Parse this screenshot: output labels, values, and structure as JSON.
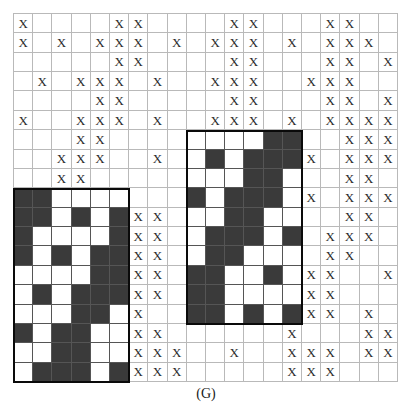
{
  "figure": {
    "caption": "(G)",
    "mark_glyph": "X",
    "grid": {
      "columns": 20,
      "rows": 19
    },
    "colors": {
      "mark": "#2b2b2b",
      "gridline": "#b9b9b9",
      "region_border": "#0a0a0a",
      "dark_cell": "#3a3a3a",
      "light_cell": "#ffffff",
      "background": "#ffffff"
    },
    "regions": [
      {
        "name": "left-region",
        "col_start": 0,
        "col_end": 5,
        "row_start": 9,
        "row_end": 18
      },
      {
        "name": "right-region",
        "col_start": 9,
        "col_end": 14,
        "row_start": 6,
        "row_end": 15
      }
    ],
    "marks": [
      [
        1,
        0,
        0,
        0,
        0,
        1,
        1,
        0,
        0,
        0,
        0,
        1,
        1,
        0,
        0,
        0,
        1,
        1,
        0,
        0
      ],
      [
        1,
        0,
        1,
        0,
        1,
        1,
        1,
        0,
        1,
        0,
        1,
        1,
        1,
        0,
        1,
        0,
        1,
        1,
        1,
        0
      ],
      [
        0,
        0,
        0,
        0,
        0,
        1,
        1,
        0,
        0,
        0,
        0,
        1,
        1,
        0,
        0,
        0,
        1,
        1,
        0,
        1
      ],
      [
        0,
        1,
        0,
        1,
        1,
        1,
        0,
        1,
        0,
        0,
        1,
        1,
        1,
        0,
        0,
        1,
        1,
        1,
        0,
        0
      ],
      [
        0,
        0,
        0,
        0,
        1,
        1,
        0,
        0,
        0,
        0,
        0,
        1,
        1,
        0,
        0,
        0,
        1,
        1,
        0,
        1
      ],
      [
        1,
        0,
        0,
        1,
        1,
        1,
        0,
        1,
        0,
        0,
        1,
        1,
        1,
        0,
        1,
        0,
        1,
        1,
        1,
        1
      ],
      [
        0,
        0,
        0,
        1,
        1,
        0,
        0,
        0,
        0,
        0,
        0,
        0,
        0,
        0,
        0,
        0,
        0,
        1,
        1,
        1
      ],
      [
        0,
        0,
        1,
        1,
        1,
        0,
        0,
        1,
        0,
        0,
        0,
        0,
        0,
        0,
        0,
        1,
        0,
        1,
        1,
        1
      ],
      [
        0,
        0,
        1,
        1,
        0,
        0,
        0,
        0,
        0,
        0,
        0,
        0,
        0,
        0,
        0,
        0,
        0,
        1,
        1,
        0
      ],
      [
        0,
        0,
        0,
        0,
        0,
        0,
        0,
        0,
        0,
        0,
        0,
        0,
        0,
        0,
        0,
        1,
        0,
        1,
        1,
        1
      ],
      [
        0,
        0,
        0,
        0,
        0,
        0,
        1,
        1,
        0,
        0,
        0,
        0,
        0,
        0,
        0,
        0,
        0,
        1,
        1,
        0
      ],
      [
        0,
        0,
        0,
        0,
        0,
        0,
        1,
        1,
        0,
        0,
        0,
        0,
        0,
        0,
        1,
        0,
        1,
        1,
        1,
        0
      ],
      [
        0,
        0,
        0,
        0,
        0,
        0,
        1,
        1,
        0,
        0,
        0,
        0,
        0,
        0,
        0,
        0,
        1,
        1,
        0,
        0
      ],
      [
        0,
        0,
        0,
        0,
        0,
        0,
        1,
        1,
        0,
        0,
        0,
        0,
        0,
        0,
        1,
        1,
        1,
        0,
        0,
        1
      ],
      [
        0,
        0,
        0,
        0,
        0,
        0,
        1,
        1,
        0,
        0,
        0,
        0,
        0,
        0,
        0,
        1,
        1,
        0,
        0,
        0
      ],
      [
        0,
        0,
        0,
        0,
        0,
        0,
        1,
        0,
        0,
        0,
        0,
        0,
        0,
        0,
        1,
        1,
        1,
        0,
        1,
        0
      ],
      [
        0,
        0,
        0,
        0,
        0,
        0,
        1,
        1,
        0,
        0,
        0,
        0,
        0,
        0,
        1,
        0,
        0,
        0,
        1,
        1
      ],
      [
        0,
        0,
        0,
        0,
        0,
        0,
        1,
        1,
        1,
        0,
        0,
        1,
        0,
        0,
        1,
        1,
        1,
        0,
        1,
        1
      ],
      [
        0,
        0,
        0,
        0,
        0,
        0,
        1,
        1,
        1,
        0,
        0,
        0,
        0,
        0,
        1,
        1,
        1,
        0,
        0,
        0
      ]
    ],
    "pattern_left": [
      [
        1,
        1,
        0,
        0,
        0,
        0
      ],
      [
        1,
        1,
        0,
        1,
        0,
        1
      ],
      [
        1,
        0,
        0,
        0,
        0,
        1
      ],
      [
        1,
        0,
        1,
        0,
        1,
        1
      ],
      [
        0,
        0,
        0,
        0,
        1,
        1
      ],
      [
        0,
        1,
        0,
        1,
        1,
        1
      ],
      [
        0,
        0,
        0,
        1,
        1,
        0
      ],
      [
        1,
        0,
        1,
        1,
        0,
        0
      ],
      [
        0,
        0,
        1,
        1,
        0,
        0
      ],
      [
        0,
        1,
        1,
        1,
        0,
        1
      ],
      [
        0,
        1,
        1,
        0,
        0,
        0
      ],
      [
        1,
        1,
        1,
        0,
        1,
        0
      ]
    ],
    "pattern_right": [
      [
        0,
        0,
        0,
        0,
        1,
        1
      ],
      [
        0,
        1,
        0,
        1,
        1,
        1
      ],
      [
        0,
        0,
        0,
        1,
        1,
        0
      ],
      [
        1,
        0,
        1,
        1,
        1,
        0
      ],
      [
        0,
        0,
        1,
        1,
        0,
        0
      ],
      [
        0,
        1,
        1,
        1,
        0,
        1
      ],
      [
        0,
        1,
        1,
        0,
        0,
        0
      ],
      [
        1,
        1,
        0,
        0,
        1,
        0
      ],
      [
        1,
        1,
        0,
        0,
        0,
        0
      ],
      [
        1,
        1,
        0,
        1,
        0,
        1
      ],
      [
        1,
        0,
        0,
        0,
        0,
        1
      ],
      [
        1,
        0,
        1,
        0,
        1,
        1
      ]
    ]
  }
}
